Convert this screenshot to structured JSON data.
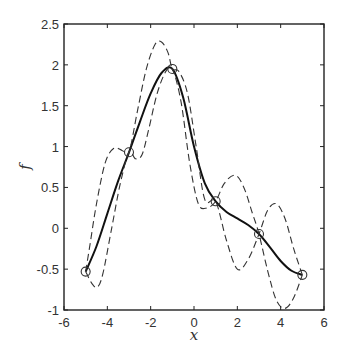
{
  "chart_data": {
    "type": "line",
    "title": "",
    "xlabel": "x",
    "ylabel": "f",
    "xlim": [
      -6,
      6
    ],
    "ylim": [
      -1,
      2.5
    ],
    "grid": false,
    "legend": null,
    "xticks": [
      -6,
      -4,
      -2,
      0,
      2,
      4,
      6
    ],
    "xtick_labels": [
      "-6",
      "-4",
      "-2",
      "0",
      "2",
      "4",
      "6"
    ],
    "yticks": [
      -1,
      -0.5,
      0,
      0.5,
      1,
      1.5,
      2,
      2.5
    ],
    "ytick_labels": [
      "-1",
      "-0.5",
      "0",
      "0.5",
      "1",
      "1.5",
      "2",
      "2.5"
    ],
    "observations": {
      "name": "data points",
      "marker": "circle",
      "x": [
        -5,
        -3,
        -1,
        1,
        3,
        5
      ],
      "y": [
        -0.53,
        0.93,
        1.95,
        0.33,
        -0.07,
        -0.57
      ]
    },
    "series": [
      {
        "name": "mean",
        "style": "solid",
        "x": [
          -5,
          -4.5,
          -4,
          -3.5,
          -3,
          -2.5,
          -2,
          -1.5,
          -1,
          -0.5,
          0,
          0.5,
          1,
          1.5,
          2,
          2.5,
          3,
          3.5,
          4,
          4.5,
          5
        ],
        "y": [
          -0.53,
          -0.22,
          0.18,
          0.58,
          0.93,
          1.3,
          1.65,
          1.9,
          1.95,
          1.6,
          1.0,
          0.55,
          0.33,
          0.2,
          0.12,
          0.04,
          -0.07,
          -0.23,
          -0.4,
          -0.52,
          -0.57
        ]
      },
      {
        "name": "sample 1",
        "style": "dashed",
        "x": [
          -5,
          -4.7,
          -4.45,
          -4.2,
          -3.8,
          -3.4,
          -3,
          -2.7,
          -2.4,
          -2.1,
          -1.7,
          -1.3,
          -1,
          -0.6,
          -0.2,
          0.2,
          0.6,
          1,
          1.4,
          1.9,
          2.3,
          2.7,
          3,
          3.4,
          3.8,
          4.2,
          4.6,
          5
        ],
        "y": [
          -0.53,
          -0.68,
          -0.72,
          -0.55,
          0.0,
          0.55,
          0.93,
          0.85,
          0.9,
          1.2,
          1.65,
          1.92,
          1.95,
          1.55,
          0.8,
          0.3,
          0.25,
          0.33,
          0.55,
          0.65,
          0.5,
          0.18,
          -0.07,
          -0.52,
          -0.88,
          -0.98,
          -0.85,
          -0.57
        ]
      },
      {
        "name": "sample 2",
        "style": "dashed",
        "x": [
          -5,
          -4.8,
          -4.5,
          -4.1,
          -3.7,
          -3.3,
          -3,
          -2.6,
          -2.2,
          -1.8,
          -1.5,
          -1.2,
          -1,
          -0.7,
          -0.3,
          0.1,
          0.5,
          1,
          1.5,
          2,
          2.5,
          3,
          3.4,
          3.8,
          4.2,
          4.6,
          5
        ],
        "y": [
          -0.53,
          -0.2,
          0.3,
          0.8,
          0.98,
          0.95,
          0.93,
          1.45,
          1.95,
          2.25,
          2.28,
          2.15,
          1.95,
          1.92,
          1.65,
          1.0,
          0.35,
          0.33,
          -0.15,
          -0.5,
          -0.38,
          -0.07,
          0.22,
          0.3,
          0.12,
          -0.25,
          -0.57
        ]
      }
    ]
  },
  "figure": {
    "plot_area_px": {
      "left": 64,
      "top": 24,
      "right": 324,
      "bottom": 310
    }
  }
}
